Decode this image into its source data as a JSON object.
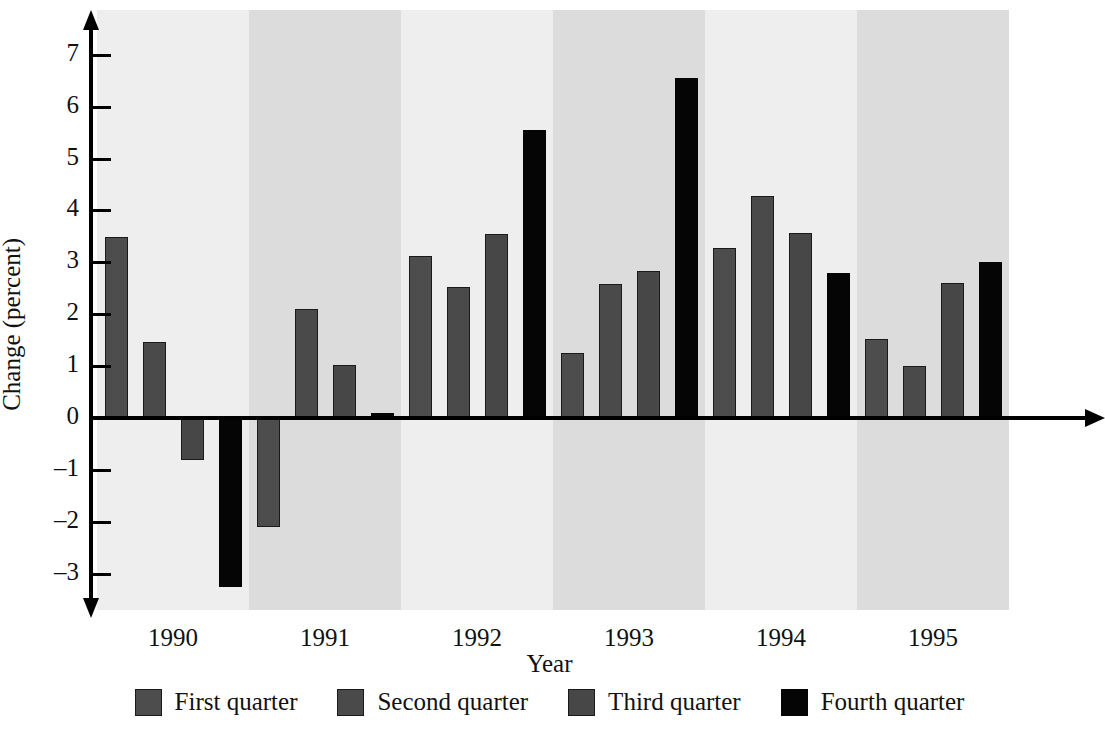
{
  "chart_data": {
    "type": "bar",
    "title": "",
    "xlabel": "Year",
    "ylabel": "Change (percent)",
    "categories": [
      "1990",
      "1991",
      "1992",
      "1993",
      "1994",
      "1995"
    ],
    "ylim": [
      -3.6,
      7.4
    ],
    "yticks": [
      7,
      6,
      5,
      4,
      3,
      2,
      1,
      0,
      -1,
      -2,
      -3
    ],
    "ytick_labels": [
      "7",
      "6",
      "5",
      "4",
      "3",
      "2",
      "1",
      "0",
      "–1",
      "–2",
      "–3"
    ],
    "grid": false,
    "legend_position": "bottom",
    "series": [
      {
        "name": "First quarter",
        "color": "#4d4d4d",
        "values": [
          3.48,
          -2.1,
          3.12,
          1.25,
          3.27,
          1.52
        ]
      },
      {
        "name": "Second quarter",
        "color": "#4a4a4a",
        "values": [
          1.47,
          2.1,
          2.52,
          2.58,
          4.27,
          1.0
        ]
      },
      {
        "name": "Third quarter",
        "color": "#474747",
        "values": [
          -0.8,
          1.03,
          3.54,
          2.83,
          3.57,
          2.6
        ]
      },
      {
        "name": "Fourth quarter",
        "color": "#050505",
        "values": [
          -3.25,
          0.1,
          5.55,
          6.55,
          2.8,
          3.0
        ]
      }
    ],
    "band_shading": [
      "light",
      "dark",
      "light",
      "dark",
      "light",
      "dark"
    ],
    "band_colors": {
      "light": "#eeeeee",
      "dark": "#dcdcdc"
    }
  },
  "legend": {
    "items": [
      {
        "label": "First quarter",
        "swatch": "#4d4d4d"
      },
      {
        "label": "Second quarter",
        "swatch": "#4a4a4a"
      },
      {
        "label": "Third quarter",
        "swatch": "#474747"
      },
      {
        "label": "Fourth quarter",
        "swatch": "#050505"
      }
    ]
  }
}
